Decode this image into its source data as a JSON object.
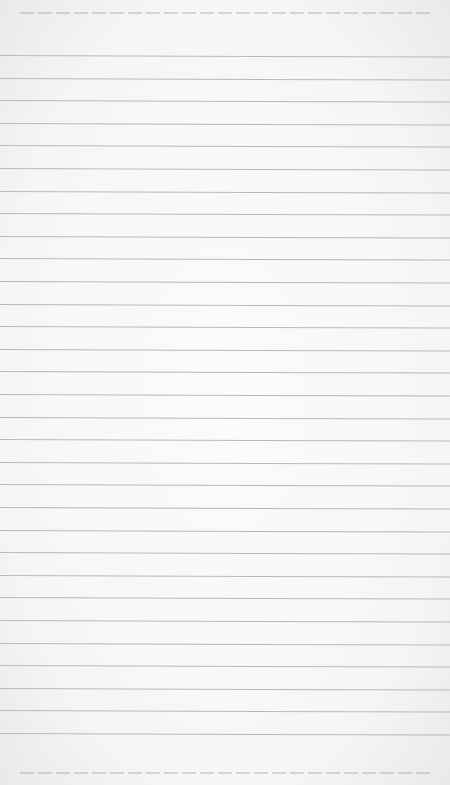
{
  "paper": {
    "type": "lined notebook paper",
    "background_color": "#f7f7f7",
    "line_color": "#b9b9b9",
    "line_count": 31,
    "first_line_y": 55,
    "line_spacing_px": 22.6
  }
}
